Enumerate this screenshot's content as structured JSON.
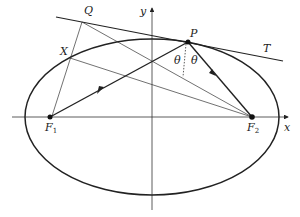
{
  "diagram": {
    "colors": {
      "stroke": "#222222",
      "background": "#ffffff"
    },
    "axes": {
      "x_label": "x",
      "y_label": "y"
    },
    "points": {
      "P": {
        "label": "P",
        "x": 188,
        "y": 42
      },
      "Q": {
        "label": "Q",
        "x": 82,
        "y": 22
      },
      "X": {
        "label": "X",
        "x": 70,
        "y": 58
      },
      "F1": {
        "label": "F",
        "sub": "1",
        "x": 50,
        "y": 117
      },
      "F2": {
        "label": "F",
        "sub": "2",
        "x": 252,
        "y": 117
      }
    },
    "tangent_label": "T",
    "angle_labels": [
      "θ",
      "θ"
    ]
  }
}
